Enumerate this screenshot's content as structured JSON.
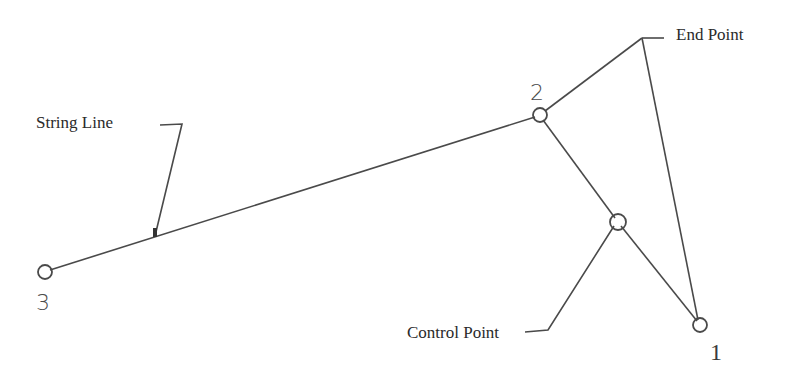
{
  "diagram": {
    "type": "string-line-geometry",
    "points": [
      {
        "id": "1",
        "label": "1",
        "x": 700,
        "y": 325
      },
      {
        "id": "2",
        "label": "2",
        "x": 540,
        "y": 115
      },
      {
        "id": "3",
        "label": "3",
        "x": 45,
        "y": 272
      },
      {
        "id": "control",
        "label": "",
        "x": 618,
        "y": 222
      }
    ],
    "callouts": {
      "string_line": "String Line",
      "end_point": "End Point",
      "control_point": "Control Point"
    },
    "colors": {
      "line": "#4a4a4a",
      "text": "#2a2a2a",
      "background": "#ffffff"
    }
  }
}
